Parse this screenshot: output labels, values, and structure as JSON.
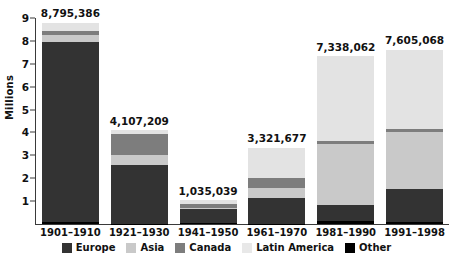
{
  "chart_data": {
    "type": "bar",
    "stacked": true,
    "title": "",
    "xlabel": "",
    "ylabel": "Millions",
    "ylim": [
      0,
      9
    ],
    "ytick_step": 1,
    "ytick_labels": [
      "9",
      "8",
      "7",
      "6",
      "5",
      "4",
      "3",
      "2",
      "1"
    ],
    "ytick_values": [
      9,
      8,
      7,
      6,
      5,
      4,
      3,
      2,
      1
    ],
    "grid": false,
    "legend_position": "bottom",
    "categories": [
      "1901–1910",
      "1921–1930",
      "1941–1950",
      "1961–1970",
      "1981–1990",
      "1991–1998"
    ],
    "totals": [
      8795386,
      4107209,
      1035039,
      3321677,
      7338062,
      7605068
    ],
    "total_labels": [
      "8,795,386",
      "4,107,209",
      "1,035,039",
      "3,321,677",
      "7,338,062",
      "7,605,068"
    ],
    "series": [
      {
        "name": "Europe",
        "color": "#333333",
        "values": [
          7850000,
          2560000,
          620000,
          1120000,
          705000,
          1430000
        ]
      },
      {
        "name": "Canada",
        "color": "#7d7d7d",
        "values": [
          180000,
          920000,
          170000,
          430000,
          120000,
          160000
        ]
      },
      {
        "name": "Asia",
        "color": "#c9c9c9",
        "values": [
          330000,
          450000,
          40000,
          430000,
          2650000,
          2470000
        ]
      },
      {
        "name": "Latin America",
        "color": "#e3e3e3",
        "values": [
          340000,
          160000,
          180000,
          1320000,
          3730000,
          3440000
        ]
      },
      {
        "name": "Other",
        "color": "#000000",
        "values": [
          95386,
          17209,
          25039,
          21677,
          133062,
          105068
        ]
      }
    ],
    "stack_order": [
      "Other",
      "Europe",
      "Asia",
      "Canada",
      "Latin America"
    ]
  },
  "legend": {
    "items": [
      {
        "label": "Europe",
        "color": "#333333"
      },
      {
        "label": "Asia",
        "color": "#c9c9c9"
      },
      {
        "label": "Canada",
        "color": "#7d7d7d"
      },
      {
        "label": "Latin America",
        "color": "#e8e8e8"
      },
      {
        "label": "Other",
        "color": "#000000"
      }
    ]
  },
  "axis": {
    "y_title": "Millions"
  }
}
